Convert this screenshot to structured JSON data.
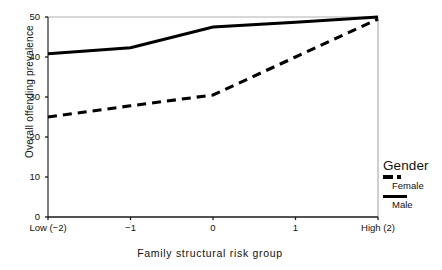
{
  "chart_data": {
    "type": "line",
    "title": "",
    "xlabel": "Family structural risk group",
    "ylabel": "Overall offending prevalence",
    "categories": [
      "Low (−2)",
      "−1",
      "0",
      "1",
      "High (2)"
    ],
    "x": [
      -2,
      -1,
      0,
      1,
      2
    ],
    "series": [
      {
        "name": "Female",
        "style": "dashed",
        "color": "#000000",
        "values": [
          25.0,
          27.8,
          30.5,
          40.0,
          49.5
        ]
      },
      {
        "name": "Male",
        "style": "solid",
        "color": "#000000",
        "values": [
          40.8,
          42.3,
          47.5,
          48.7,
          50.0
        ]
      }
    ],
    "ylim": [
      0,
      50
    ],
    "yticks": [
      0,
      10,
      20,
      30,
      40,
      50
    ],
    "ytick_labels": [
      "0",
      "10",
      "20",
      "30",
      "40",
      "50"
    ],
    "grid": false,
    "legend_position": "right",
    "legend_title": "Gender"
  },
  "axes": {
    "y_title": "Overall offending prevalence",
    "x_title": "Family structural risk group",
    "y_ticks": [
      {
        "label": "50",
        "value": 50
      },
      {
        "label": "40",
        "value": 40
      },
      {
        "label": "30",
        "value": 30
      },
      {
        "label": "20",
        "value": 20
      },
      {
        "label": "10",
        "value": 10
      },
      {
        "label": "0",
        "value": 0
      }
    ],
    "x_ticks": [
      {
        "label": "Low (−2)",
        "value": -2
      },
      {
        "label": "−1",
        "value": -1
      },
      {
        "label": "0",
        "value": 0
      },
      {
        "label": "1",
        "value": 1
      },
      {
        "label": "High (2)",
        "value": 2
      }
    ]
  },
  "legend": {
    "title": "Gender",
    "entries": [
      {
        "label": "Female",
        "style": "dashed"
      },
      {
        "label": "Male",
        "style": "solid"
      }
    ]
  },
  "colors": {
    "series_line": "#000000",
    "axis_line": "#1a1a1a",
    "frame_line": "#b0b0b0",
    "background": "#ffffff"
  }
}
